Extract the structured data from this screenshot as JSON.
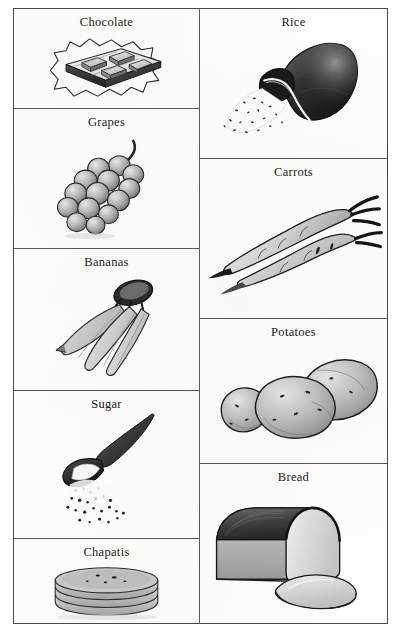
{
  "figure": {
    "background_color": "#fdfdfc",
    "border_color": "#4a4a4a",
    "ink_color": "#1a1a1a",
    "columns": 2,
    "style": "pencil-shaded line drawings of food items in a bordered two-column grid"
  },
  "left_column": {
    "cells": [
      {
        "label": "Chocolate",
        "icon": "chocolate-bar-icon"
      },
      {
        "label": "Grapes",
        "icon": "grape-bunch-icon"
      },
      {
        "label": "Bananas",
        "icon": "banana-bunch-icon"
      },
      {
        "label": "Sugar",
        "icon": "sugar-spoon-icon"
      },
      {
        "label": "Chapatis",
        "icon": "chapati-stack-icon"
      }
    ]
  },
  "right_column": {
    "cells": [
      {
        "label": "Rice",
        "icon": "rice-sack-icon"
      },
      {
        "label": "Carrots",
        "icon": "carrots-icon"
      },
      {
        "label": "Potatoes",
        "icon": "potatoes-icon"
      },
      {
        "label": "Bread",
        "icon": "bread-loaf-icon"
      }
    ]
  }
}
